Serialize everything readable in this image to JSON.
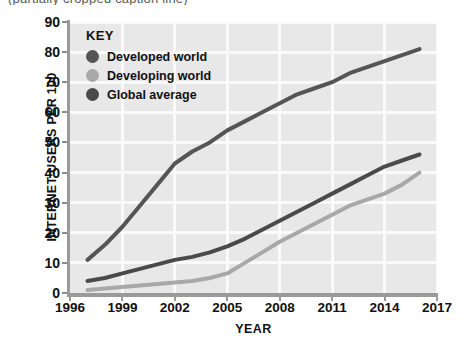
{
  "top_caption": {
    "text": "(partially cropped caption line)"
  },
  "chart_data": {
    "type": "line",
    "title": "",
    "subtitle": "",
    "xlabel": "YEAR",
    "ylabel": "INTERNET USERS PER 100",
    "xlim": [
      1996,
      2017
    ],
    "ylim": [
      0,
      90
    ],
    "xticks": [
      "1996",
      "1999",
      "2002",
      "2005",
      "2008",
      "2011",
      "2014",
      "2017"
    ],
    "xtick_values": [
      1996,
      1999,
      2002,
      2005,
      2008,
      2011,
      2014,
      2017
    ],
    "yticks": [
      "0",
      "10",
      "20",
      "30",
      "40",
      "50",
      "60",
      "70",
      "80",
      "90"
    ],
    "ytick_values": [
      0,
      10,
      20,
      30,
      40,
      50,
      60,
      70,
      80,
      90
    ],
    "grid": true,
    "grid_color": "#fafafa",
    "plot_background": "#e8e8e8",
    "legend_title": "KEY",
    "legend_position": "top-left-inside",
    "series": [
      {
        "name": "Developed world",
        "color": "#555555",
        "x": [
          1997,
          1998,
          1999,
          2000,
          2001,
          2002,
          2003,
          2004,
          2005,
          2006,
          2007,
          2008,
          2009,
          2010,
          2011,
          2012,
          2013,
          2014,
          2015,
          2016
        ],
        "values": [
          11,
          16,
          22,
          29,
          36,
          43,
          47,
          50,
          54,
          57,
          60,
          63,
          66,
          68,
          70,
          73,
          75,
          77,
          79,
          81
        ]
      },
      {
        "name": "Developing world",
        "color": "#a8a8a8",
        "x": [
          1997,
          1998,
          1999,
          2000,
          2001,
          2002,
          2003,
          2004,
          2005,
          2006,
          2007,
          2008,
          2009,
          2010,
          2011,
          2012,
          2013,
          2014,
          2015,
          2016
        ],
        "values": [
          1,
          1.5,
          2,
          2.5,
          3,
          3.5,
          4,
          5,
          6.5,
          10,
          13.5,
          17,
          20,
          23,
          26,
          29,
          31,
          33,
          36,
          40
        ]
      },
      {
        "name": "Global average",
        "color": "#4a4a4a",
        "x": [
          1997,
          1998,
          1999,
          2000,
          2001,
          2002,
          2003,
          2004,
          2005,
          2006,
          2007,
          2008,
          2009,
          2010,
          2011,
          2012,
          2013,
          2014,
          2015,
          2016
        ],
        "values": [
          4,
          5,
          6.5,
          8,
          9.5,
          11,
          12,
          13.5,
          15.5,
          18,
          21,
          24,
          27,
          30,
          33,
          36,
          39,
          42,
          44,
          46
        ]
      }
    ],
    "annotations": []
  }
}
